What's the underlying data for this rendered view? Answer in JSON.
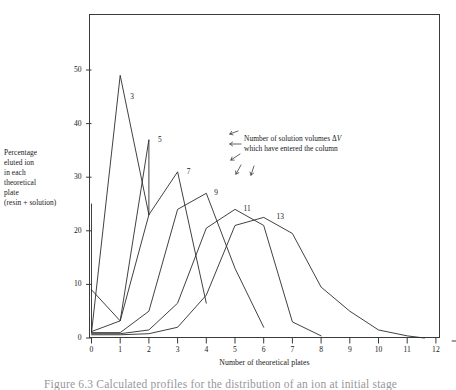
{
  "figure": {
    "background_color": "#ffffff",
    "ink_color": "#1a1a1a",
    "curve_color": "#2b2b2b"
  },
  "axes": {
    "y_label_lines": [
      "Percentage",
      "eluted ion",
      "in each",
      "theoretical",
      "plate",
      "(resin + solution)"
    ],
    "x_title": "Number of theoretical plates",
    "y_ticks": [
      "0",
      "10",
      "20",
      "30",
      "40",
      "50"
    ],
    "x_ticks": [
      "0",
      "1",
      "2",
      "3",
      "4",
      "5",
      "6",
      "7",
      "8",
      "9",
      "10",
      "11",
      "12"
    ]
  },
  "annotation": {
    "line1_prefix": "Number of solution volumes ",
    "line1_delta": "Δ",
    "line1_v": "V",
    "line2": "which have entered the column"
  },
  "series_labels": [
    "3",
    "5",
    "7",
    "9",
    "11",
    "13"
  ],
  "caption": {
    "text": "Figure 6.3   Calculated profiles for the distribution of an ion at initial stage"
  },
  "chart_data": {
    "type": "line",
    "title": "",
    "xlabel": "Number of theoretical plates",
    "ylabel": "Percentage eluted ion in each theoretical plate (resin + solution)",
    "xlim": [
      0,
      12.3
    ],
    "ylim": [
      0,
      60.5
    ],
    "grid": false,
    "legend": "inline-curve-labels",
    "annotations": [
      {
        "text": "Number of solution volumes ΔV which have entered the column",
        "x": 5.35,
        "y": 43.0
      }
    ],
    "series": [
      {
        "name": "3",
        "label": "3",
        "label_x": 1.35,
        "label_y": 45.0,
        "points": [
          [
            0.0,
            25.0
          ],
          [
            0.0,
            7.5
          ],
          [
            0.0,
            1.0
          ],
          [
            1.0,
            49.0
          ],
          [
            2.0,
            23.0
          ]
        ],
        "points_note": "steep rise from axis to peak 49 at plate 1, falls to 23 at plate 2"
      },
      {
        "name": "5",
        "label": "5",
        "label_x": 2.32,
        "label_y": 37.0,
        "points": [
          [
            0.0,
            9.0
          ],
          [
            1.0,
            3.2
          ],
          [
            2.0,
            37.0
          ],
          [
            2.0,
            23.0
          ]
        ],
        "points_note": "rises from near axis to peak 37 at plate 2"
      },
      {
        "name": "7",
        "label": "7",
        "label_x": 3.32,
        "label_y": 31.0,
        "points": [
          [
            0.0,
            1.2
          ],
          [
            1.0,
            3.2
          ],
          [
            2.0,
            23.0
          ],
          [
            3.0,
            31.0
          ],
          [
            4.0,
            6.5
          ]
        ]
      },
      {
        "name": "9",
        "label": "9",
        "label_x": 4.28,
        "label_y": 27.0,
        "points": [
          [
            0.0,
            1.0
          ],
          [
            1.0,
            1.0
          ],
          [
            2.0,
            5.0
          ],
          [
            3.0,
            24.0
          ],
          [
            4.0,
            27.0
          ],
          [
            5.0,
            13.0
          ],
          [
            6.0,
            2.0
          ]
        ]
      },
      {
        "name": "11",
        "label": "11",
        "label_x": 5.3,
        "label_y": 24.0,
        "points": [
          [
            0.0,
            0.8
          ],
          [
            1.0,
            0.8
          ],
          [
            2.0,
            1.5
          ],
          [
            3.0,
            6.5
          ],
          [
            4.0,
            20.5
          ],
          [
            5.0,
            24.0
          ],
          [
            6.0,
            21.0
          ],
          [
            7.0,
            3.0
          ],
          [
            8.0,
            0.4
          ]
        ]
      },
      {
        "name": "13",
        "label": "13",
        "label_x": 6.45,
        "label_y": 22.5,
        "points": [
          [
            0.0,
            0.6
          ],
          [
            1.0,
            0.6
          ],
          [
            2.0,
            0.8
          ],
          [
            3.0,
            2.0
          ],
          [
            4.0,
            8.0
          ],
          [
            5.0,
            21.0
          ],
          [
            6.0,
            22.5
          ],
          [
            7.0,
            19.5
          ],
          [
            8.0,
            9.5
          ],
          [
            9.0,
            5.0
          ],
          [
            10.0,
            1.5
          ],
          [
            11.0,
            0.4
          ],
          [
            11.6,
            0.0
          ]
        ]
      }
    ]
  }
}
